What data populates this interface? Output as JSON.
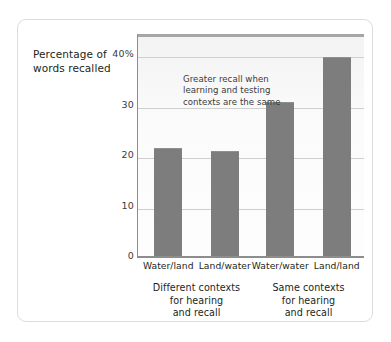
{
  "chart_data": {
    "type": "bar",
    "title": "",
    "subtitle": "",
    "xlabel": "",
    "ylabel": "Percentage of words recalled",
    "categories": [
      "Water/land",
      "Land/water",
      "Water/water",
      "Land/land"
    ],
    "values": [
      21.5,
      20.8,
      30.6,
      39.5
    ],
    "ylim": [
      0,
      44
    ],
    "y_ticks": [
      0,
      10,
      20,
      30,
      40
    ],
    "y_tick_labels": [
      "0",
      "10",
      "20",
      "30",
      "40%"
    ],
    "grid": true,
    "legend": "none",
    "bar_color": "#7d7d7d",
    "plot_background": "#fbfbfb",
    "gridline_color": "#cfcfcf",
    "axis_color": "#8d8d8d",
    "annotations": [
      {
        "lines": [
          "Greater recall when",
          "learning and testing",
          "contexts are the same"
        ]
      }
    ],
    "group_captions": [
      {
        "lines": [
          "Different contexts",
          "for hearing",
          "and recall"
        ],
        "categories": [
          "Water/land",
          "Land/water"
        ]
      },
      {
        "lines": [
          "Same contexts",
          "for hearing",
          "and recall"
        ],
        "categories": [
          "Water/water",
          "Land/land"
        ]
      }
    ]
  },
  "axis_title": {
    "line1": "Percentage of",
    "line2": "words recalled"
  }
}
